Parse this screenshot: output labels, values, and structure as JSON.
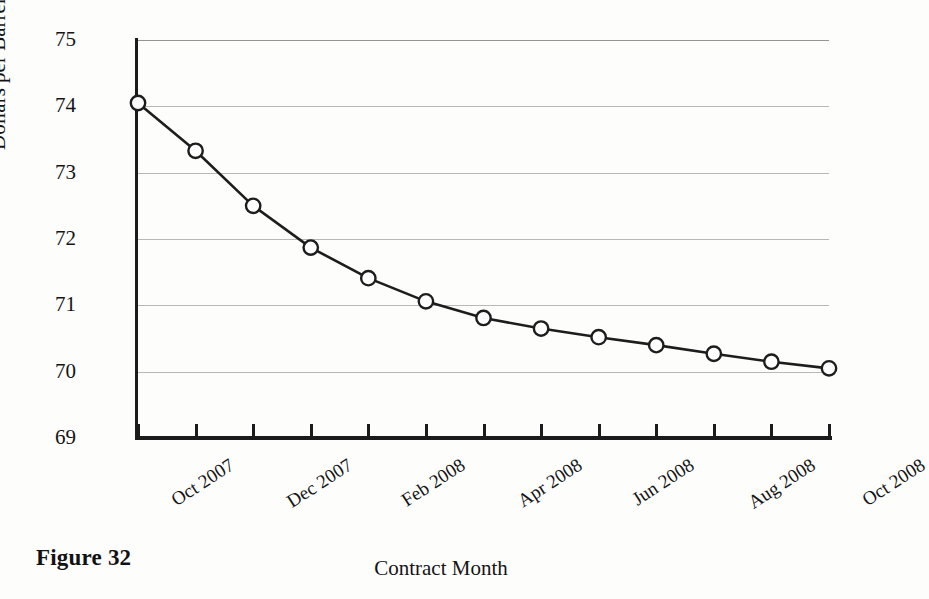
{
  "figure": {
    "caption": "Figure 32"
  },
  "chart_data": {
    "type": "line",
    "title": "",
    "xlabel": "Contract Month",
    "ylabel": "Dollars per Barrel",
    "x": [
      "Oct 2007",
      "Nov 2007",
      "Dec 2007",
      "Jan 2008",
      "Feb 2008",
      "Mar 2008",
      "Apr 2008",
      "May 2008",
      "Jun 2008",
      "Jul 2008",
      "Aug 2008",
      "Sep 2008",
      "Oct 2008"
    ],
    "values": [
      74.05,
      73.33,
      72.5,
      71.87,
      71.41,
      71.06,
      70.81,
      70.65,
      70.52,
      70.4,
      70.27,
      70.15,
      70.05
    ],
    "series": [
      {
        "name": "Futures price",
        "values": [
          74.05,
          73.33,
          72.5,
          71.87,
          71.41,
          71.06,
          70.81,
          70.65,
          70.52,
          70.4,
          70.27,
          70.15,
          70.05
        ]
      }
    ],
    "ylim": [
      69,
      75
    ],
    "yticks": [
      69,
      70,
      71,
      72,
      73,
      74,
      75
    ],
    "ytick_labels": [
      "69",
      "70",
      "71",
      "72",
      "73",
      "74",
      "75"
    ],
    "xtick_labels": [
      "Oct 2007",
      "",
      "Dec 2007",
      "",
      "Feb 2008",
      "",
      "Apr 2008",
      "",
      "Jun 2008",
      "",
      "Aug 2008",
      "",
      "Oct 2008"
    ],
    "visible_xtick_labels": [
      "Oct 2007",
      "Dec 2007",
      "Feb 2008",
      "Apr 2008",
      "Jun 2008",
      "Aug 2008",
      "Oct 2008"
    ],
    "gridlines": [
      70,
      71,
      72,
      73,
      74,
      75
    ],
    "grid": true,
    "legend": null,
    "legend_position": "none",
    "marker": "open-circle",
    "line_color": "#1d1d1d",
    "marker_fill": "#ffffff",
    "grid_color": "#7a7a7a",
    "axis_color": "#1b1b1b"
  }
}
